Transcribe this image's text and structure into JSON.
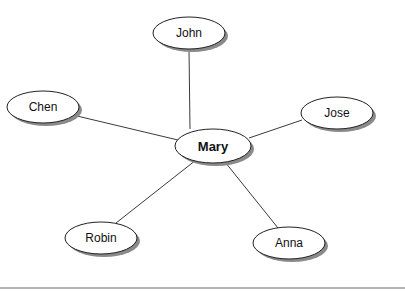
{
  "diagram": {
    "type": "star-network",
    "center": {
      "id": "mary",
      "label": "Mary",
      "bold": true,
      "cx": 213,
      "cy": 146,
      "rx": 38,
      "ry": 17
    },
    "nodes": [
      {
        "id": "john",
        "label": "John",
        "cx": 189,
        "cy": 33,
        "rx": 36,
        "ry": 16
      },
      {
        "id": "chen",
        "label": "Chen",
        "cx": 43,
        "cy": 107,
        "rx": 36,
        "ry": 16
      },
      {
        "id": "jose",
        "label": "Jose",
        "cx": 337,
        "cy": 113,
        "rx": 36,
        "ry": 16
      },
      {
        "id": "robin",
        "label": "Robin",
        "cx": 101,
        "cy": 238,
        "rx": 36,
        "ry": 16
      },
      {
        "id": "anna",
        "label": "Anna",
        "cx": 289,
        "cy": 243,
        "rx": 36,
        "ry": 16
      }
    ],
    "edges": [
      {
        "from": "mary",
        "to": "john"
      },
      {
        "from": "mary",
        "to": "chen"
      },
      {
        "from": "mary",
        "to": "jose"
      },
      {
        "from": "mary",
        "to": "robin"
      },
      {
        "from": "mary",
        "to": "anna"
      }
    ],
    "colors": {
      "edge": "#3a3a3a",
      "node_fill": "#ffffff",
      "node_stroke": "#222222",
      "shadow": "#8a8a8a",
      "baseline": "#6b6b6b"
    }
  }
}
